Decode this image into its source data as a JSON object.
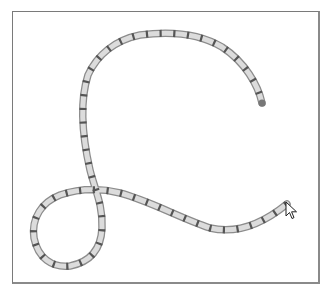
{
  "canvas": {
    "frame": {
      "x": 12,
      "y": 11,
      "width": 308,
      "height": 273,
      "border_color": "#7a7a7a"
    },
    "background": "#ffffff"
  },
  "chain_path": {
    "description": "Segmented chain/rope stroke drawn on canvas",
    "stroke_outer_color": "#8c8c8c",
    "stroke_inner_color": "#d9d9d9",
    "joint_color": "#555555",
    "stroke_width": 7,
    "path_d": "M262,103 C258,85 245,62 222,47 C200,34 170,31 140,35 C115,40 97,55 88,75 C80,100 82,135 90,170 C95,190 103,205 102,228 C101,250 90,262 70,266 C52,268 38,258 34,238 C31,218 42,202 60,195 C78,189 100,188 120,193 C150,201 180,218 210,228 C235,234 260,226 287,204",
    "start_point": {
      "x": 262,
      "y": 103
    },
    "end_point": {
      "x": 287,
      "y": 204
    }
  },
  "cursor": {
    "type": "arrow-pointer",
    "x": 286,
    "y": 202
  }
}
